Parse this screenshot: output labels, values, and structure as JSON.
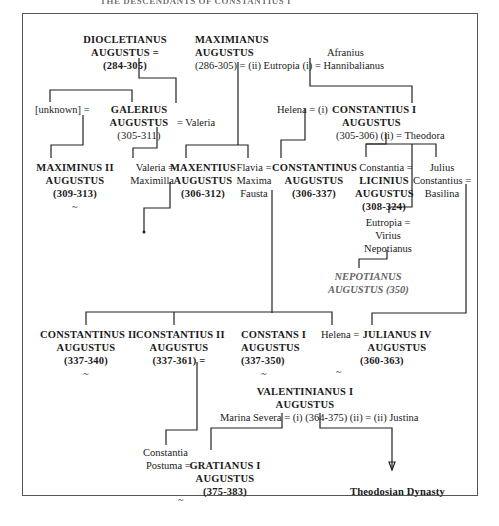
{
  "header": {
    "title": "THE DESCENDANTS OF CONSTANTIUS I"
  },
  "persons": {
    "diocletianus": {
      "line1": "DIOCLETIANUS",
      "line2": "AUGUSTUS =",
      "line3": "(284-305)"
    },
    "maximianus": {
      "line1": "MAXIMIANUS",
      "line2": "AUGUSTUS",
      "line3": "(286-305) = (ii) Eutropia (i) = Hannibalianus"
    },
    "afranius": {
      "line1": "Afranius"
    },
    "unknown": {
      "line1": "[unknown] ="
    },
    "galerius": {
      "line1": "GALERIUS",
      "line2": "AUGUSTUS",
      "spouse": "= Valeria",
      "line3": "(305-311)"
    },
    "helena1": {
      "line1": "Helena = (i)"
    },
    "constantius1": {
      "line1": "CONSTANTIUS I",
      "line2": "AUGUSTUS",
      "line3": "(305-306) (ii) = Theodora"
    },
    "maximinus2": {
      "line1": "MAXIMINUS II",
      "line2": "AUGUSTUS",
      "line3": "(309-313)",
      "tilde": "~"
    },
    "valeria_maximilla": {
      "line1": "Valeria =",
      "line2": "Maximilla"
    },
    "maxentius": {
      "line1": "MAXENTIUS",
      "line2": "AUGUSTUS",
      "line3": "(306-312)"
    },
    "fausta": {
      "line1": "Flavia =",
      "line2": "Maxima",
      "line3": "Fausta"
    },
    "constantinus": {
      "line1": "CONSTANTINUS",
      "line2": "AUGUSTUS",
      "line3": "(306-337)"
    },
    "constantia": {
      "line1": "Constantia ="
    },
    "licinius": {
      "line1": "LICINIUS",
      "line2": "AUGUSTUS",
      "line3": "(308-324)"
    },
    "julius_constantius": {
      "line1": "Julius",
      "line2": "Constantius =",
      "line3": "Basilina"
    },
    "eutropia2": {
      "line1": "Eutropia =",
      "line2": "Virius",
      "line3": "Nepotianus"
    },
    "nepotianus": {
      "line1": "NEPOTIANUS",
      "line2": "AUGUSTUS (350)"
    },
    "constantinus2": {
      "line1": "CONSTANTINUS II",
      "line2": "AUGUSTUS",
      "line3": "(337-340)",
      "tilde": "~"
    },
    "constantius2": {
      "line1": "CONSTANTIUS II",
      "line2": "AUGUSTUS",
      "line3": "(337-361) ="
    },
    "constans1": {
      "line1": "CONSTANS I",
      "line2": "AUGUSTUS",
      "line3": "(337-350)",
      "tilde": "~"
    },
    "helena2": {
      "line1": "Helena =",
      "tilde": "~"
    },
    "julianus4": {
      "line1": "JULIANUS IV",
      "line2": "AUGUSTUS",
      "line3": "(360-363)"
    },
    "valentinianus1": {
      "line1": "VALENTINIANUS I",
      "line2": "AUGUSTUS",
      "line3": "Marina Severa = (i) (364-375) (ii) = (ii) Justina"
    },
    "constantia_postuma": {
      "line1": "Constantia",
      "line2": "Postuma ="
    },
    "gratianus1": {
      "line1": "GRATIANUS I",
      "line2": "AUGUSTUS",
      "line3": "(375-383)",
      "tilde": "~"
    },
    "theodosian": {
      "line1": "Theodosian Dynasty"
    }
  }
}
